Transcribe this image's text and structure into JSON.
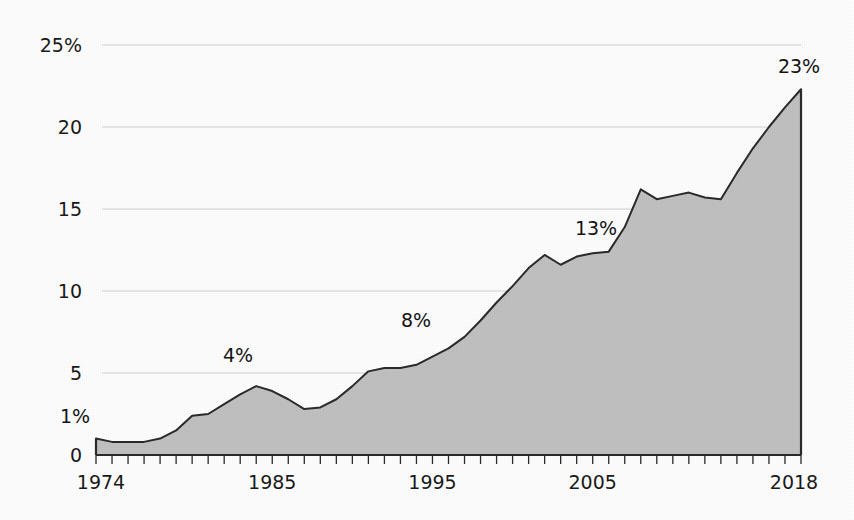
{
  "chart_data": {
    "type": "area",
    "title": "",
    "subtitle": "",
    "xlabel": "",
    "ylabel": "",
    "xlim": [
      1974,
      2018
    ],
    "ylim": [
      0,
      25
    ],
    "grid": true,
    "legend": "none",
    "y_ticks": [
      {
        "value": 25,
        "label": "25%"
      },
      {
        "value": 20,
        "label": "20"
      },
      {
        "value": 15,
        "label": "15"
      },
      {
        "value": 10,
        "label": "10"
      },
      {
        "value": 5,
        "label": "5"
      },
      {
        "value": 0,
        "label": "0"
      }
    ],
    "x_ticks": [
      {
        "value": 1974,
        "label": "1974"
      },
      {
        "value": 1985,
        "label": "1985"
      },
      {
        "value": 1995,
        "label": "1995"
      },
      {
        "value": 2005,
        "label": "2005"
      },
      {
        "value": 2018,
        "label": "2018"
      }
    ],
    "x_minor_tick_step": 1,
    "x": [
      1974,
      1975,
      1976,
      1977,
      1978,
      1979,
      1980,
      1981,
      1982,
      1983,
      1984,
      1985,
      1986,
      1987,
      1988,
      1989,
      1990,
      1991,
      1992,
      1993,
      1994,
      1995,
      1996,
      1997,
      1998,
      1999,
      2000,
      2001,
      2002,
      2003,
      2004,
      2005,
      2006,
      2007,
      2008,
      2009,
      2010,
      2011,
      2012,
      2013,
      2014,
      2015,
      2016,
      2017,
      2018
    ],
    "values": [
      1.0,
      0.8,
      0.8,
      0.8,
      1.0,
      1.5,
      2.4,
      2.5,
      3.1,
      3.7,
      4.2,
      3.9,
      3.4,
      2.8,
      2.9,
      3.4,
      4.2,
      5.1,
      5.3,
      5.3,
      5.5,
      6.0,
      6.5,
      7.2,
      8.2,
      9.3,
      10.3,
      11.4,
      12.2,
      11.6,
      12.1,
      12.3,
      12.4,
      13.9,
      16.2,
      15.6,
      15.8,
      16.0,
      15.7,
      15.6,
      17.2,
      18.7,
      20.0,
      21.2,
      22.3
    ],
    "series_name": "share",
    "fill_color": "#c2c2c2",
    "line_color": "#2b2b2b",
    "grid_color": "#d2d2d2",
    "axis_color": "#2b2b2b",
    "annotations": [
      {
        "label": "1%",
        "x": 1974,
        "value": 1.0,
        "px": 75,
        "py": 423
      },
      {
        "label": "4%",
        "x": 1984,
        "value": 4.2,
        "px": 238,
        "py": 362
      },
      {
        "label": "8%",
        "x": 1998,
        "value": 8.2,
        "px": 416,
        "py": 327
      },
      {
        "label": "13%",
        "x": 2007,
        "value": 13.9,
        "px": 596,
        "py": 235
      },
      {
        "label": "23%",
        "x": 2018,
        "value": 22.3,
        "px": 799,
        "py": 73
      }
    ]
  },
  "plot_geometry": {
    "left_px": 96,
    "right_px": 801,
    "top_px": 45,
    "bottom_px": 455
  }
}
